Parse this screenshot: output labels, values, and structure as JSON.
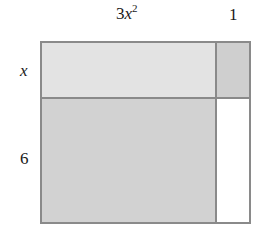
{
  "diagram": {
    "type": "area-model-rectangle",
    "top_labels": {
      "left": {
        "coef": "3",
        "var": "x",
        "exp": "2"
      },
      "right": "1"
    },
    "side_labels": {
      "top": "x",
      "bottom": "6"
    },
    "cells": [
      {
        "id": "top-left",
        "row": "x",
        "col": "3x^2",
        "fill": "#e3e3e3"
      },
      {
        "id": "top-right",
        "row": "x",
        "col": "1",
        "fill": "#cfcfcf"
      },
      {
        "id": "bottom-left",
        "row": "6",
        "col": "3x^2",
        "fill": "#d2d2d2"
      },
      {
        "id": "bottom-right",
        "row": "6",
        "col": "1",
        "fill": "#ffffff"
      }
    ],
    "colors": {
      "border": "#8a8a8a",
      "text": "#1a1a1a",
      "background": "#ffffff"
    }
  }
}
